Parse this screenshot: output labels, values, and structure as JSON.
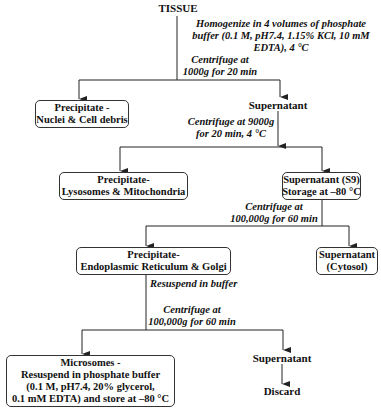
{
  "diagram": {
    "title": "TISSUE",
    "steps": {
      "homogenize": [
        "Homogenize in 4 volumes of phosphate",
        "buffer (0.1 M, pH7.4, 1.15% KCl, 10 mM",
        "EDTA), 4 °C"
      ],
      "centrifuge_1": [
        "Centrifuge at",
        "1000g for 20 min"
      ],
      "centrifuge_2": [
        "Centrifuge at 9000g",
        "for 20 min, 4 °C"
      ],
      "centrifuge_3": [
        "Centrifuge at",
        "100,000g for 60 min"
      ],
      "resuspend": "Resuspend in buffer",
      "centrifuge_4": [
        "Centrifuge at",
        "100,000g for 60 min"
      ]
    },
    "nodes": {
      "precipitate_nuclei": [
        "Precipitate -",
        "Nuclei & Cell debris"
      ],
      "supernatant_1": "Supernatant",
      "precipitate_lysosomes": [
        "Precipitate-",
        "Lysosomes & Mitochondria"
      ],
      "supernatant_s9": [
        "Supernatant (S9)",
        "Storage at –80 °C"
      ],
      "precipitate_er": [
        "Precipitate-",
        "Endoplasmic Reticulum & Golgi"
      ],
      "supernatant_cytosol": [
        "Supernatant",
        "(Cytosol)"
      ],
      "microsomes": [
        "Microsomes -",
        "Resuspend in phosphate buffer",
        "(0.1 M, pH7.4, 20% glycerol,",
        "0.1 mM EDTA) and store at –80 °C"
      ],
      "supernatant_2": "Supernatant",
      "discard": "Discard"
    },
    "colors": {
      "line": "#222222",
      "box_border": "#333333",
      "text": "#111111"
    }
  }
}
